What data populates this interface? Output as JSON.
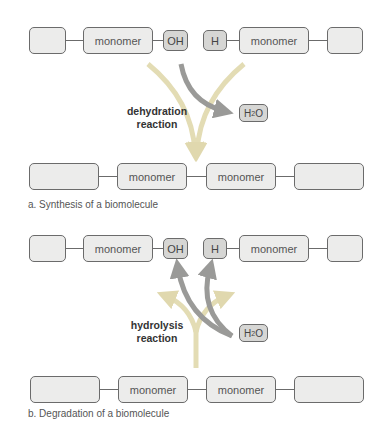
{
  "panel_a": {
    "top_row": {
      "left_monomer": "monomer",
      "oh": "OH",
      "h": "H",
      "right_monomer": "monomer"
    },
    "reaction_label_1": "dehydration",
    "reaction_label_2": "reaction",
    "water": {
      "h": "H",
      "sub": "2",
      "o": "O"
    },
    "bottom_row": {
      "monomer_1": "monomer",
      "monomer_2": "monomer"
    },
    "caption": "a. Synthesis of a biomolecule"
  },
  "panel_b": {
    "top_row": {
      "left_monomer": "monomer",
      "oh": "OH",
      "h": "H",
      "right_monomer": "monomer"
    },
    "reaction_label_1": "hydrolysis",
    "reaction_label_2": "reaction",
    "water": {
      "h": "H",
      "sub": "2",
      "o": "O"
    },
    "bottom_row": {
      "monomer_1": "monomer",
      "monomer_2": "monomer"
    },
    "caption": "b. Degradation of a biomolecule"
  },
  "colors": {
    "pale_arrow": "#e3dcb4",
    "dark_arrow": "#9a9a98",
    "box_fill": "#ececeb",
    "small_box_fill": "#d6d6d4",
    "border": "#6b6b6b"
  }
}
